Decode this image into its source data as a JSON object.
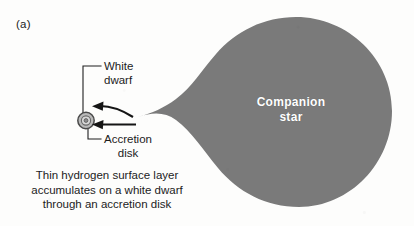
{
  "figure": {
    "panel_label": "(a)",
    "caption": "Thin hydrogen surface layer\naccumulates on a white dwarf\nthrough an accretion disk"
  },
  "labels": {
    "white_dwarf": "White\ndwarf",
    "accretion_disk": "Accretion\ndisk",
    "companion_star": "Companion\nstar"
  },
  "icons": {
    "white_dwarf": "white-dwarf-icon",
    "accretion_disk": "accretion-disk-icon",
    "flow_arrow_upper": "accretion-flow-arrow-icon",
    "flow_arrow_lower": "accretion-flow-arrow-icon",
    "companion_star": "roche-lobe-teardrop-icon",
    "leader_white_dwarf": "leader-line",
    "leader_accretion_disk": "leader-line"
  },
  "colors": {
    "background": "#fdfdfc",
    "star_fill": "#7a7a7a",
    "ink": "#1c1c1c",
    "label_on_star": "#ffffff",
    "disk_ring": "#8c8c8c",
    "dwarf_core": "#cfcfcf"
  }
}
